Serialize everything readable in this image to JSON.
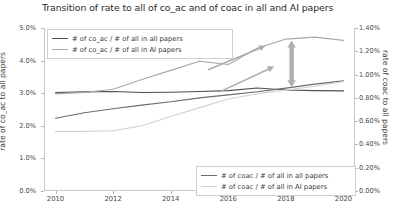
{
  "chart_data": {
    "type": "line",
    "title": "Transition of rate to all of co_ac and of coac in all and AI papers",
    "xlabel": "",
    "ylabel_left": "rate of co_ac to all papers",
    "ylabel_right": "rate of coac to all papers",
    "x": [
      2010,
      2011,
      2012,
      2013,
      2014,
      2015,
      2016,
      2017,
      2018,
      2019,
      2020
    ],
    "xticks": [
      "2010",
      "2012",
      "2014",
      "2016",
      "2018",
      "2020"
    ],
    "xlim": [
      2009.6,
      2020.4
    ],
    "yticks_left": [
      "0.0%",
      "1.0%",
      "2.0%",
      "3.0%",
      "4.0%",
      "5.0%"
    ],
    "ylim_left": [
      0.0,
      5.0
    ],
    "yticks_right": [
      "0.00%",
      "0.20%",
      "0.40%",
      "0.60%",
      "0.80%",
      "1.00%",
      "1.20%",
      "1.40%"
    ],
    "ylim_right": [
      0.0,
      1.4
    ],
    "grid": false,
    "legend_position": "upper-left and lower-right",
    "series": [
      {
        "name": "# of co_ac / # of all in all papers",
        "axis": "left",
        "color": "#4f4f4f",
        "values": [
          3.02,
          3.04,
          3.05,
          3.02,
          3.03,
          3.05,
          3.08,
          3.16,
          3.1,
          3.08,
          3.07
        ]
      },
      {
        "name": "# of co_ac / # of all in AI papers",
        "axis": "left",
        "color": "#a8a8a8",
        "values": [
          2.98,
          3.02,
          3.12,
          3.42,
          3.7,
          3.98,
          3.88,
          4.38,
          4.66,
          4.72,
          4.62
        ]
      },
      {
        "name": "# of coac / # of all in all papers",
        "axis": "right",
        "color": "#6b6b6b",
        "values": [
          0.625,
          0.672,
          0.706,
          0.738,
          0.766,
          0.8,
          0.826,
          0.852,
          0.884,
          0.918,
          0.946
        ]
      },
      {
        "name": "# of coac / # of all in AI papers",
        "axis": "right",
        "color": "#d2d2d2",
        "values": [
          0.512,
          0.512,
          0.518,
          0.56,
          0.64,
          0.716,
          0.79,
          0.836,
          0.866,
          0.9,
          0.94
        ]
      }
    ],
    "annotations": [
      {
        "name": "growth-arrow-upper",
        "type": "arrow",
        "x1": 2015.3,
        "y1": 3.72,
        "x2": 2017.2,
        "y2": 4.42
      },
      {
        "name": "growth-arrow-lower",
        "type": "arrow",
        "x1": 2015.7,
        "y1": 3.04,
        "x2": 2017.5,
        "y2": 3.78
      },
      {
        "name": "gap-arrow-double",
        "type": "double-arrow",
        "x": 2018.2,
        "y_top": 4.62,
        "y_bottom": 3.18
      }
    ]
  },
  "legend_top": {
    "items": [
      {
        "label": "# of co_ac / # of all in all papers"
      },
      {
        "label": "# of co_ac / # of all in AI papers"
      }
    ]
  },
  "legend_bottom": {
    "items": [
      {
        "label": "# of coac / # of all in all papers"
      },
      {
        "label": "# of coac / # of all in AI papers"
      }
    ]
  }
}
